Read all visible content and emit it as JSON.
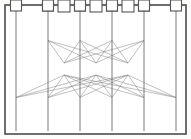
{
  "figure": {
    "type": "diagram",
    "canvas": {
      "width": 191,
      "height": 139
    },
    "background_color": "#fdfdfc"
  },
  "frame": {
    "x": 5,
    "y": 5,
    "width": 181,
    "height": 129,
    "stroke_color": "#4a4a4a",
    "stroke_width": 1.6,
    "fill_color": "#ffffff"
  },
  "style": {
    "node_stroke_color": "#555555",
    "node_fill_color": "#ffffff",
    "node_stroke_width": 1.1,
    "terminal_color": "#3a3a3a",
    "edge_color": "#8c8c8c",
    "edge_width": 0.55,
    "stem_color": "#6b6b6b",
    "stem_width": 0.9
  },
  "layers": [
    {
      "id": "input-terminals",
      "label": "Input terminals",
      "role": "terminal",
      "count": 4,
      "y": 6,
      "node_size": 3.6,
      "nodes": [
        {
          "id": "t-in-1",
          "label": "IN1",
          "x": 48
        },
        {
          "id": "t-in-2",
          "label": "IN2",
          "x": 80
        },
        {
          "id": "t-in-3",
          "label": "IN3",
          "x": 112
        },
        {
          "id": "t-in-4",
          "label": "IN4",
          "x": 144
        }
      ]
    },
    {
      "id": "layer-1",
      "label": "Layer 1",
      "role": "node",
      "count": 4,
      "y": 35,
      "node_size": 11,
      "nodes": [
        {
          "id": "n1-1",
          "label": "A1",
          "x": 48
        },
        {
          "id": "n1-2",
          "label": "A2",
          "x": 80
        },
        {
          "id": "n1-3",
          "label": "A3",
          "x": 112
        },
        {
          "id": "n1-4",
          "label": "A4",
          "x": 144
        }
      ]
    },
    {
      "id": "layer-2",
      "label": "Layer 2",
      "role": "node",
      "count": 3,
      "y": 69,
      "node_size": 12,
      "nodes": [
        {
          "id": "n2-1",
          "label": "B1",
          "x": 64
        },
        {
          "id": "n2-2",
          "label": "B2",
          "x": 96
        },
        {
          "id": "n2-3",
          "label": "B3",
          "x": 128
        }
      ]
    },
    {
      "id": "layer-3",
      "label": "Layer 3",
      "role": "node",
      "count": 6,
      "y": 103,
      "node_size": 11,
      "nodes": [
        {
          "id": "n3-1",
          "label": "C1",
          "x": 16
        },
        {
          "id": "n3-2",
          "label": "C2",
          "x": 48
        },
        {
          "id": "n3-3",
          "label": "C3",
          "x": 80
        },
        {
          "id": "n3-4",
          "label": "C4",
          "x": 112
        },
        {
          "id": "n3-5",
          "label": "C5",
          "x": 144
        },
        {
          "id": "n3-6",
          "label": "C6",
          "x": 176
        }
      ]
    },
    {
      "id": "output-terminals",
      "label": "Output terminals",
      "role": "terminal",
      "count": 6,
      "y": 131,
      "node_size": 3.6,
      "nodes": [
        {
          "id": "t-out-1",
          "label": "OUT1",
          "x": 16
        },
        {
          "id": "t-out-2",
          "label": "OUT2",
          "x": 48
        },
        {
          "id": "t-out-3",
          "label": "OUT3",
          "x": 80
        },
        {
          "id": "t-out-4",
          "label": "OUT4",
          "x": 112
        },
        {
          "id": "t-out-5",
          "label": "OUT5",
          "x": 144
        },
        {
          "id": "t-out-6",
          "label": "OUT6",
          "x": 176
        }
      ]
    }
  ],
  "edge_groups": [
    {
      "id": "stems-input",
      "label": "Input stems",
      "kind": "stem",
      "from_layer": "input-terminals",
      "to_layer": "layer-1",
      "pairing": "one-to-one"
    },
    {
      "id": "edges-l1-l2",
      "label": "Layer 1 to Layer 2 connections",
      "kind": "edge",
      "from_layer": "layer-1",
      "to_layer": "layer-2",
      "pairing": "complete-bipartite",
      "edge_count": 12
    },
    {
      "id": "edges-l2-l3",
      "label": "Layer 2 to Layer 3 connections",
      "kind": "edge",
      "from_layer": "layer-2",
      "to_layer": "layer-3",
      "pairing": "complete-bipartite",
      "edge_count": 18
    },
    {
      "id": "stems-output",
      "label": "Output stems",
      "kind": "stem",
      "from_layer": "layer-3",
      "to_layer": "output-terminals",
      "pairing": "one-to-one"
    }
  ]
}
